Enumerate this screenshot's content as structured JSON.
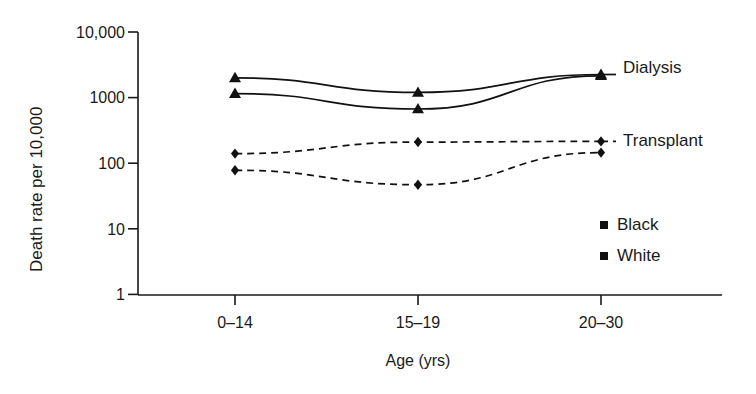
{
  "chart_data": {
    "type": "line",
    "title": "",
    "subtitle": "",
    "xlabel": "Age (yrs)",
    "ylabel": "Death rate per 10,000",
    "categories": [
      "0–14",
      "15–19",
      "20–30"
    ],
    "yscale": "log",
    "ylim": [
      1,
      10000
    ],
    "yticks": [
      1,
      10,
      100,
      1000,
      10000
    ],
    "ytick_labels": [
      "1",
      "10",
      "100",
      "1000",
      "10,000"
    ],
    "grid": false,
    "legend_position": "right-inside",
    "series": [
      {
        "name": "Dialysis – Black",
        "group": "Dialysis",
        "cohort": "Black",
        "marker": "triangle",
        "linestyle": "solid",
        "values": [
          2000,
          1200,
          2250
        ]
      },
      {
        "name": "Dialysis – White",
        "group": "Dialysis",
        "cohort": "White",
        "marker": "triangle",
        "linestyle": "solid",
        "values": [
          1150,
          670,
          2150
        ]
      },
      {
        "name": "Transplant – Black",
        "group": "Transplant",
        "cohort": "Black",
        "marker": "diamond",
        "linestyle": "dashed",
        "values": [
          140,
          210,
          215
        ]
      },
      {
        "name": "Transplant – White",
        "group": "Transplant",
        "cohort": "White",
        "marker": "diamond",
        "linestyle": "dashed",
        "values": [
          78,
          47,
          145
        ]
      }
    ],
    "annotations": [
      {
        "text": "Dialysis",
        "attached_to": "Dialysis"
      },
      {
        "text": "Transplant",
        "attached_to": "Transplant"
      }
    ],
    "legend": [
      {
        "label": "Black",
        "marker": "square"
      },
      {
        "label": "White",
        "marker": "square"
      }
    ],
    "colors": {
      "line": "#111111",
      "marker": "#111111",
      "axis": "#1a1a1a",
      "text": "#1a1a1a",
      "background": "#ffffff"
    }
  },
  "axis": {
    "y_ticks": [
      {
        "label": "10,000"
      },
      {
        "label": "1000"
      },
      {
        "label": "100"
      },
      {
        "label": "10"
      },
      {
        "label": "1"
      }
    ],
    "y_title": "Death rate per 10,000",
    "x_categories": [
      {
        "label": "0–14"
      },
      {
        "label": "15–19"
      },
      {
        "label": "20–30"
      }
    ],
    "x_title": "Age (yrs)"
  },
  "annotations": {
    "dialysis": "Dialysis",
    "transplant": "Transplant"
  },
  "legend": {
    "black": "Black",
    "white": "White"
  }
}
